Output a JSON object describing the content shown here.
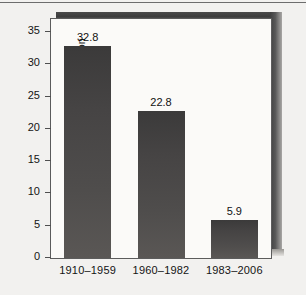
{
  "chart_data": {
    "type": "bar",
    "title": "",
    "xlabel": "",
    "ylabel": "Percent of Time in Recession",
    "categories": [
      "1910–1959",
      "1960–1982",
      "1983–2006"
    ],
    "values": [
      32.8,
      22.8,
      5.9
    ],
    "value_labels": [
      "32.8",
      "22.8",
      "5.9"
    ],
    "ylim": [
      0,
      37
    ],
    "yticks": [
      0,
      5,
      10,
      15,
      20,
      25,
      30,
      35
    ],
    "ytick_labels": [
      "0",
      "5",
      "10",
      "15",
      "20",
      "25",
      "30",
      "35"
    ],
    "grid": false,
    "legend": null,
    "bar_color": "#474545",
    "panel_color": "#fbfaf8",
    "axis_color": "#5c5c5c"
  },
  "figure": {
    "background_color": "#f2f1ef",
    "shadow_color": "#3f3f3f"
  }
}
